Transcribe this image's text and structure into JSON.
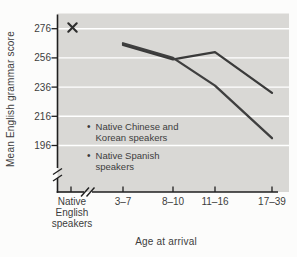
{
  "chart_data": {
    "type": "line",
    "title": "",
    "xlabel": "Age at arrival",
    "ylabel": "Mean English grammar score",
    "y_ticks": [
      276,
      256,
      236,
      216,
      196
    ],
    "ylim": [
      188,
      286
    ],
    "y_axis_break": true,
    "x_axis_break": true,
    "grid": "horizontal white gridlines",
    "plot_bg_color": "#d9d8d5",
    "gridline_color": "#ffffff",
    "axis_color": "#1f1f1f",
    "text_color": "#3d3d3d",
    "baseline": {
      "label": "Native English speakers",
      "marker": "X",
      "marker_color": "#2d2d2d",
      "value": 276
    },
    "categories": [
      "3–7",
      "8–10",
      "11–16",
      "17–39"
    ],
    "series": [
      {
        "name": "Native Chinese and Korean speakers",
        "values": [
          265,
          255,
          260,
          232
        ],
        "color": "#3a3a3a"
      },
      {
        "name": "Native Spanish speakers",
        "values": [
          266,
          256,
          237,
          201
        ],
        "color": "#3f3f3f"
      }
    ],
    "legend_position": "inside lower-left of plot"
  }
}
